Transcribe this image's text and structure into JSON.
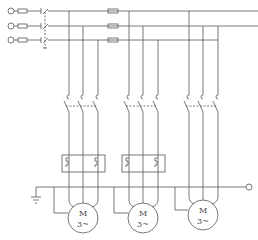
{
  "diagram": {
    "type": "three-motor starter schematic",
    "phases": 3,
    "bus_y": [
      11,
      26,
      40
    ],
    "colors": {
      "line": "#555555",
      "background": "#ffffff"
    },
    "motors": [
      {
        "label_top": "M",
        "label_bottom": "3~",
        "cx": 83,
        "cy": 218,
        "has_thermal_relay": true
      },
      {
        "label_top": "M",
        "label_bottom": "3~",
        "cx": 143,
        "cy": 218,
        "has_thermal_relay": true
      },
      {
        "label_top": "M",
        "label_bottom": "3~",
        "cx": 203,
        "cy": 215,
        "has_thermal_relay": false
      }
    ]
  },
  "motor1": {
    "top": "M",
    "bottom": "3~"
  },
  "motor2": {
    "top": "M",
    "bottom": "3~"
  },
  "motor3": {
    "top": "M",
    "bottom": "3~"
  }
}
